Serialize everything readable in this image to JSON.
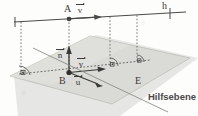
{
  "figure": {
    "kind": "geometry-diagram",
    "width": 198,
    "height": 116,
    "background": "#fdfdfc",
    "ink_color": "#3a3a3a",
    "plane_fill": "#d8d8d4",
    "plane_stroke": "#b4b4b0",
    "helper_plane_fill": "#cfcfca"
  },
  "labels": {
    "point_a": "A",
    "point_b": "B",
    "line_h": "h",
    "plane_e": "E",
    "helper_plane": "Hilfsebene"
  },
  "vectors": {
    "v_top": "v",
    "v_plane": "v",
    "n_normal": "n",
    "u_plane": "u"
  },
  "markers": {
    "right_angle_count": 3,
    "right_angle_symbol": "square-dot"
  }
}
